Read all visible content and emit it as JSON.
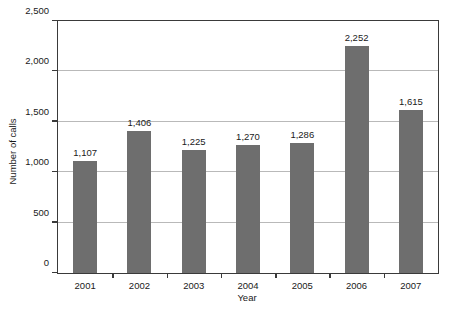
{
  "chart_data": {
    "type": "bar",
    "title": "",
    "title_clipped_text": "",
    "xlabel": "Year",
    "ylabel": "Number of calls",
    "categories": [
      "2001",
      "2002",
      "2003",
      "2004",
      "2005",
      "2006",
      "2007"
    ],
    "values": [
      1107,
      1406,
      1225,
      1270,
      1286,
      2252,
      1615
    ],
    "value_labels": [
      "1,107",
      "1,406",
      "1,225",
      "1,270",
      "1,286",
      "2,252",
      "1,615"
    ],
    "ylim": [
      0,
      2500
    ],
    "ytick_values": [
      0,
      500,
      1000,
      1500,
      2000,
      2500
    ],
    "ytick_labels": [
      "0",
      "500",
      "1,000",
      "1,500",
      "2,000",
      "2,500"
    ],
    "grid": "horizontal",
    "legend": "none",
    "series_name": "Number of calls",
    "bar_color": "#6e6e6e",
    "gridline_color": "#b9b9b9",
    "axis_color": "#3a3a3a",
    "background_color": "#ffffff"
  }
}
